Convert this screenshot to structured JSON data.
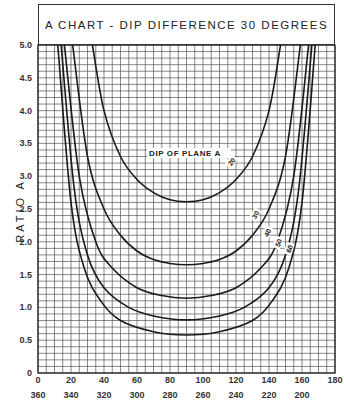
{
  "chart_data": {
    "type": "line",
    "title": "A CHART - DIP DIFFERENCE 30 DEGREES",
    "xlabel": "",
    "ylabel": "RATIO A",
    "xlim": [
      0,
      180
    ],
    "ylim": [
      0,
      5.0
    ],
    "x_ticks_top_row": [
      "0",
      "20",
      "40",
      "60",
      "80",
      "100",
      "120",
      "140",
      "160",
      "180"
    ],
    "x_ticks_bottom_row": [
      "360",
      "340",
      "320",
      "300",
      "280",
      "260",
      "240",
      "220",
      "200"
    ],
    "y_ticks": [
      "0",
      "0.5",
      "1.0",
      "1.5",
      "2.0",
      "2.5",
      "3.0",
      "3.5",
      "4.0",
      "4.5",
      "5.0"
    ],
    "grid": true,
    "grid_spacing": {
      "x": 5,
      "y": 0.1
    },
    "annotation": "DIP OF PLANE A",
    "series": [
      {
        "name": "20",
        "min": 2.61,
        "x": [
          33,
          40,
          50,
          60,
          70,
          80,
          90,
          100,
          110,
          120,
          130,
          140,
          147
        ],
        "values": [
          5.0,
          4.0,
          3.3,
          2.95,
          2.75,
          2.64,
          2.61,
          2.64,
          2.75,
          2.95,
          3.3,
          4.0,
          5.0
        ]
      },
      {
        "name": "30",
        "min": 1.65,
        "x": [
          21,
          30,
          40,
          50,
          60,
          70,
          80,
          90,
          100,
          110,
          120,
          130,
          140,
          150,
          159
        ],
        "values": [
          5.0,
          3.3,
          2.5,
          2.1,
          1.86,
          1.73,
          1.67,
          1.65,
          1.67,
          1.73,
          1.86,
          2.1,
          2.5,
          3.3,
          5.0
        ]
      },
      {
        "name": "40",
        "min": 1.14,
        "x": [
          16,
          25,
          35,
          45,
          60,
          75,
          90,
          105,
          120,
          135,
          145,
          155,
          164
        ],
        "values": [
          5.0,
          3.0,
          2.0,
          1.6,
          1.3,
          1.18,
          1.14,
          1.18,
          1.3,
          1.6,
          2.0,
          3.0,
          5.0
        ]
      },
      {
        "name": "50",
        "min": 0.81,
        "x": [
          14,
          22,
          30,
          40,
          55,
          70,
          90,
          110,
          125,
          140,
          150,
          158,
          166
        ],
        "values": [
          5.0,
          2.8,
          1.8,
          1.3,
          1.0,
          0.87,
          0.81,
          0.87,
          1.0,
          1.3,
          1.8,
          2.8,
          5.0
        ]
      },
      {
        "name": "60",
        "min": 0.58,
        "x": [
          12,
          20,
          28,
          38,
          50,
          70,
          90,
          110,
          130,
          142,
          152,
          160,
          168
        ],
        "values": [
          5.0,
          2.6,
          1.6,
          1.1,
          0.8,
          0.63,
          0.58,
          0.63,
          0.8,
          1.1,
          1.6,
          2.6,
          5.0
        ]
      }
    ]
  }
}
